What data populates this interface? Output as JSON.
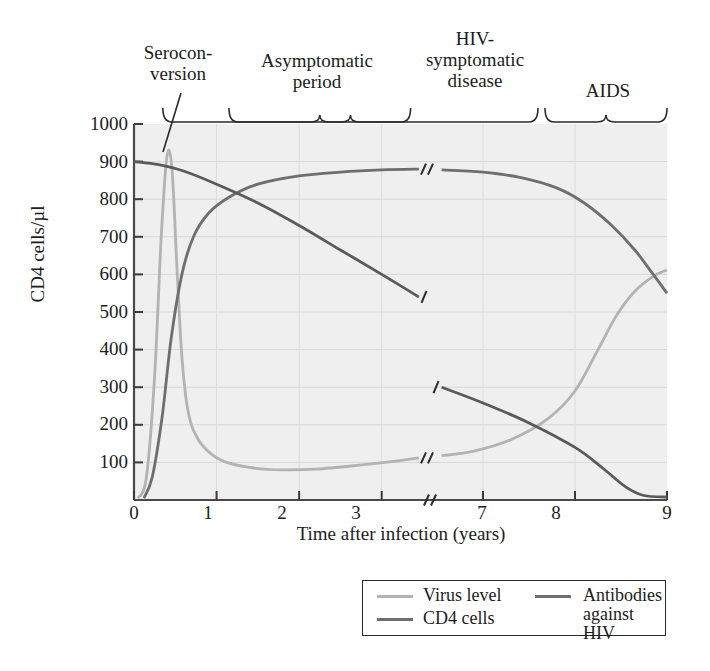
{
  "chart_data": {
    "type": "line",
    "title": "",
    "xlabel": "Time after infection (years)",
    "ylabel": "CD4 cells/µl",
    "xlim": [
      0,
      9
    ],
    "ylim": [
      0,
      1000
    ],
    "grid": true,
    "axis_break": {
      "after": 3.5,
      "before": 6.5,
      "marker": "//"
    },
    "xticks": [
      "0",
      "1",
      "2",
      "3",
      "7",
      "8",
      "9"
    ],
    "yticks": [
      "1000",
      "900",
      "800",
      "700",
      "600",
      "500",
      "400",
      "300",
      "200",
      "100"
    ],
    "legend_position": "bottom-right",
    "series": [
      {
        "name": "Virus level",
        "color": "#b3b3b3",
        "points": [
          [
            0.05,
            5
          ],
          [
            0.15,
            60
          ],
          [
            0.25,
            330
          ],
          [
            0.33,
            700
          ],
          [
            0.4,
            915
          ],
          [
            0.46,
            880
          ],
          [
            0.52,
            620
          ],
          [
            0.58,
            380
          ],
          [
            0.66,
            230
          ],
          [
            0.78,
            160
          ],
          [
            0.95,
            120
          ],
          [
            1.15,
            98
          ],
          [
            1.45,
            85
          ],
          [
            1.8,
            80
          ],
          [
            2.2,
            82
          ],
          [
            2.7,
            92
          ],
          [
            3.2,
            104
          ],
          [
            3.45,
            112
          ],
          [
            6.55,
            118
          ],
          [
            6.9,
            130
          ],
          [
            7.3,
            160
          ],
          [
            7.7,
            215
          ],
          [
            8.0,
            290
          ],
          [
            8.25,
            400
          ],
          [
            8.45,
            490
          ],
          [
            8.65,
            555
          ],
          [
            8.85,
            595
          ],
          [
            9.0,
            612
          ]
        ]
      },
      {
        "name": "CD4 cells",
        "color": "#6e6e6e",
        "points": [
          [
            0.0,
            900
          ],
          [
            0.3,
            892
          ],
          [
            0.6,
            875
          ],
          [
            1.0,
            840
          ],
          [
            1.5,
            790
          ],
          [
            2.0,
            730
          ],
          [
            2.5,
            665
          ],
          [
            3.0,
            600
          ],
          [
            3.45,
            540
          ],
          [
            6.55,
            300
          ],
          [
            7.0,
            258
          ],
          [
            7.5,
            205
          ],
          [
            8.0,
            140
          ],
          [
            8.3,
            85
          ],
          [
            8.55,
            35
          ],
          [
            8.75,
            12
          ],
          [
            9.0,
            8
          ]
        ]
      },
      {
        "name": "Antibodies against HIV",
        "color": "#6e6e6e",
        "points": [
          [
            0.12,
            5
          ],
          [
            0.22,
            60
          ],
          [
            0.34,
            220
          ],
          [
            0.45,
            430
          ],
          [
            0.58,
            600
          ],
          [
            0.72,
            700
          ],
          [
            0.9,
            762
          ],
          [
            1.15,
            805
          ],
          [
            1.5,
            840
          ],
          [
            2.0,
            862
          ],
          [
            2.5,
            872
          ],
          [
            3.0,
            878
          ],
          [
            3.45,
            880
          ],
          [
            6.55,
            878
          ],
          [
            7.0,
            872
          ],
          [
            7.4,
            858
          ],
          [
            7.8,
            830
          ],
          [
            8.1,
            790
          ],
          [
            8.4,
            730
          ],
          [
            8.65,
            665
          ],
          [
            8.85,
            600
          ],
          [
            9.0,
            550
          ]
        ]
      }
    ],
    "annotations": [
      {
        "name": "seroconversion",
        "text": "Serocon-\nversion",
        "type": "pointer",
        "target": [
          0.42,
          915
        ]
      },
      {
        "name": "asymptomatic-period",
        "text": "Asymptomatic\nperiod",
        "type": "brace",
        "range": [
          1.15,
          3.35
        ]
      },
      {
        "name": "hiv-symptomatic-disease",
        "text": "HIV-\nsymptomatic\ndisease",
        "type": "brace",
        "range": [
          3.5,
          7.55
        ]
      },
      {
        "name": "aids",
        "text": "AIDS",
        "type": "brace",
        "range": [
          7.6,
          9.0
        ]
      }
    ]
  },
  "labels": {
    "seroconversion": "Seroconversion",
    "seroconversion_line1": "Serocon-",
    "seroconversion_line2": "version",
    "asymptomatic_line1": "Asymptomatic",
    "asymptomatic_line2": "period",
    "hiv_line1": "HIV-",
    "hiv_line2": "symptomatic",
    "hiv_line3": "disease",
    "aids": "AIDS",
    "ylabel": "CD4 cells/µl",
    "xlabel": "Time after infection (years)"
  },
  "yticks": {
    "t1000": "1000",
    "t900": "900",
    "t800": "800",
    "t700": "700",
    "t600": "600",
    "t500": "500",
    "t400": "400",
    "t300": "300",
    "t200": "200",
    "t100": "100"
  },
  "xticks": {
    "x0": "0",
    "x1": "1",
    "x2": "2",
    "x3": "3",
    "x7": "7",
    "x8": "8",
    "x9": "9"
  },
  "legend": {
    "virus": "Virus level",
    "cd4": "CD4 cells",
    "antibodies_line1": "Antibodies",
    "antibodies_line2": "against HIV",
    "antibodies": "Antibodies against HIV"
  },
  "colors": {
    "virus": "#b3b3b3",
    "cd4": "#6e6e6e",
    "antibodies": "#6e6e6e",
    "plot_bg": "#efefef",
    "grid": "#d8d8d8",
    "axis": "#4a4a4a"
  }
}
